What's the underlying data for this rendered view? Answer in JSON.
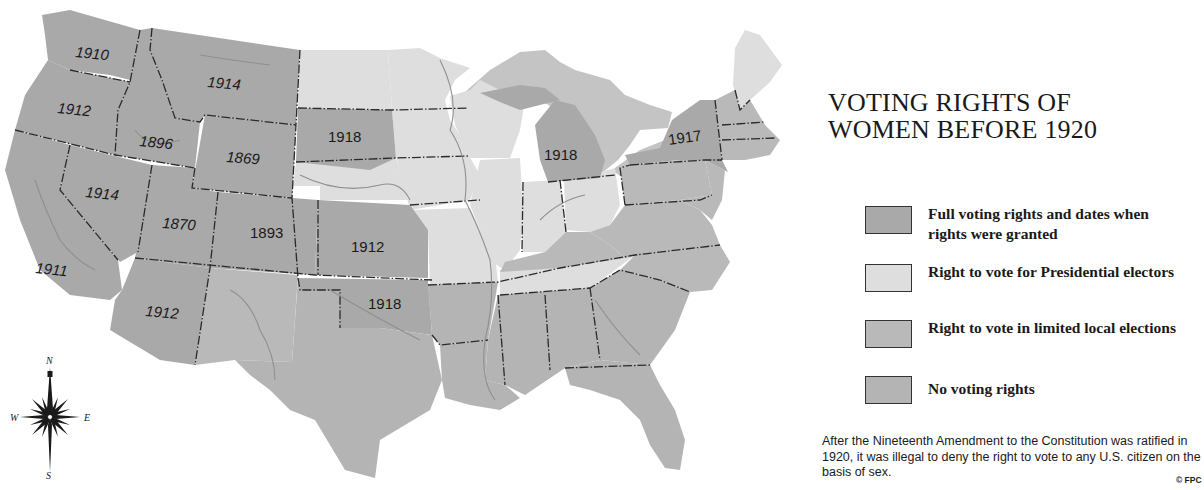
{
  "title": {
    "line1": "VOTING RIGHTS OF",
    "line2": "WOMEN BEFORE 1920"
  },
  "legend": [
    {
      "label": "Full voting rights and dates when rights were granted",
      "color": "#a9a9a9"
    },
    {
      "label": "Right to vote for Presidential electors",
      "color": "#dedede"
    },
    {
      "label": "Right to vote in limited local elections",
      "color": "#b9b9b9"
    },
    {
      "label": "No voting rights",
      "color": "#b4b4b4"
    }
  ],
  "note": "After the Nineteenth Amendment to the Constitution was ratified in 1920, it was illegal to deny the right to vote to any U.S. citizen on the basis of sex.",
  "credit": "© FPC",
  "compass": {
    "n": "N",
    "s": "S",
    "e": "E",
    "w": "W"
  },
  "states": {
    "washington": "1910",
    "oregon": "1912",
    "california": "1911",
    "idaho": "1896",
    "nevada": "1914",
    "montana": "1914",
    "wyoming": "1869",
    "utah": "1870",
    "colorado": "1893",
    "arizona": "1912",
    "south_dakota": "1918",
    "kansas": "1912",
    "oklahoma": "1918",
    "michigan": "1918",
    "new_york": "1917"
  }
}
